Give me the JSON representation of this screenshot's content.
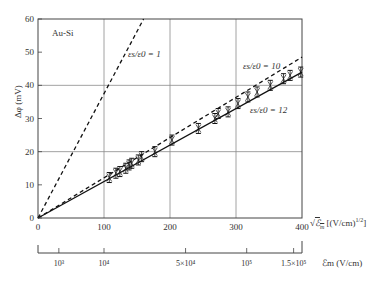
{
  "chart_data": {
    "type": "line",
    "title": "",
    "annotation_material": "Au-Si",
    "ylabel": "Δφ (mV)",
    "xlabel": "√ℰm [(V/cm)^1/2]",
    "xlabel_secondary": "ℰm (V/cm)",
    "xlim": [
      0,
      400
    ],
    "ylim": [
      0,
      60
    ],
    "grid": true,
    "legend_position": "inline annotations",
    "x_ticks": [
      "0",
      "100",
      "200",
      "300",
      "400"
    ],
    "y_ticks": [
      "0",
      "10",
      "20",
      "30",
      "40",
      "50",
      "60"
    ],
    "secondary_x_ticks": [
      {
        "label": "10³",
        "sqrt_pos": 31.6
      },
      {
        "label": "10⁴",
        "sqrt_pos": 100
      },
      {
        "label": "5×10⁴",
        "sqrt_pos": 223.6
      },
      {
        "label": "10⁵",
        "sqrt_pos": 316.2
      },
      {
        "label": "1.5×10⁵",
        "sqrt_pos": 387.3
      }
    ],
    "series": [
      {
        "name": "εs/ε0 = 1",
        "style": "dashed",
        "x": [
          0,
          160
        ],
        "y": [
          0,
          60
        ]
      },
      {
        "name": "εs/ε0 = 10",
        "style": "dashed",
        "x": [
          0,
          400
        ],
        "y": [
          0,
          48.5
        ]
      },
      {
        "name": "εs/ε0 = 12",
        "style": "solid",
        "x": [
          0,
          400
        ],
        "y": [
          0,
          44
        ]
      },
      {
        "name": "measured",
        "style": "markers-errorbars",
        "x": [
          108,
          118,
          124,
          133,
          138,
          142,
          152,
          157,
          177,
          203,
          243,
          268,
          273,
          288,
          303,
          318,
          332,
          352,
          372,
          382,
          398
        ],
        "y": [
          12.2,
          13.5,
          14.0,
          15.0,
          16.0,
          16.5,
          17.5,
          18.5,
          20.0,
          23.5,
          27.0,
          30.0,
          31.5,
          32.0,
          34.5,
          36.5,
          38.0,
          40.0,
          42.0,
          43.0,
          44.0
        ]
      }
    ]
  },
  "labels": {
    "material": "Au-Si",
    "ylabel": "Δφ (mV)",
    "curve1": "εs/ε0 = 1",
    "curve10": "εs/ε0 = 10",
    "curve12": "εs/ε0 = 12",
    "xlabel_sqrt_unit": "[(V/cm)",
    "xlabel_sqrt_exp": "1/2",
    "xlabel_field": "ℰm (V/cm)"
  }
}
